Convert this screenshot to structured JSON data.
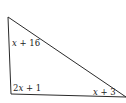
{
  "diagram": {
    "type": "triangle",
    "stroke_color": "#2a2a2a",
    "background": "#ffffff",
    "vertices": {
      "top": [
        8,
        17
      ],
      "bottom_left": [
        11,
        94
      ],
      "bottom_right": [
        126,
        97
      ]
    },
    "angles": [
      {
        "vertex": "top",
        "var": "x",
        "rest": " + 16"
      },
      {
        "vertex": "bottom_left",
        "coef": "2",
        "var": "x",
        "rest": " + 1"
      },
      {
        "vertex": "bottom_right",
        "var": "x",
        "rest": " + 3"
      }
    ]
  }
}
